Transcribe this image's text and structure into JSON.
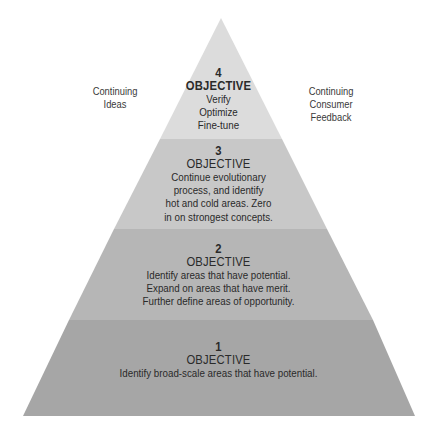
{
  "diagram": {
    "type": "pyramid",
    "side_labels": {
      "left": [
        "Continuing",
        "Ideas"
      ],
      "right": [
        "Continuing",
        "Consumer",
        "Feedback"
      ]
    },
    "levels": [
      {
        "number": "4",
        "heading": "OBJECTIVE",
        "lines": [
          "Verify",
          "Optimize",
          "Fine-tune"
        ],
        "color": "#dcdcdc"
      },
      {
        "number": "3",
        "heading": "OBJECTIVE",
        "lines": [
          "Continue evolutionary",
          "process, and identify",
          "hot and cold areas. Zero",
          "in on strongest concepts."
        ],
        "color": "#c8c8c8"
      },
      {
        "number": "2",
        "heading": "OBJECTIVE",
        "lines": [
          "Identify areas that have potential.",
          "Expand on areas that have merit.",
          "Further define areas of opportunity."
        ],
        "color": "#b6b6b6"
      },
      {
        "number": "1",
        "heading": "OBJECTIVE",
        "lines": [
          "Identify broad-scale areas that have potential."
        ],
        "color": "#a6a6a6"
      }
    ]
  }
}
